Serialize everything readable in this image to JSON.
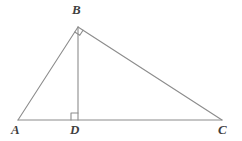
{
  "figure": {
    "type": "geometry-diagram",
    "background_color": "#ffffff",
    "stroke_color": "#8c8c8c",
    "label_color": "#3f3f3f",
    "stroke_width": 1.1
  },
  "points": {
    "A": {
      "label": "A",
      "x": 18,
      "y": 120
    },
    "B": {
      "label": "B",
      "x": 78,
      "y": 27
    },
    "C": {
      "label": "C",
      "x": 222,
      "y": 120
    },
    "D": {
      "label": "D",
      "x": 78,
      "y": 120
    }
  },
  "segments": [
    {
      "name": "AB",
      "from": "A",
      "to": "B"
    },
    {
      "name": "BC",
      "from": "B",
      "to": "C"
    },
    {
      "name": "AC",
      "from": "A",
      "to": "C"
    },
    {
      "name": "BD",
      "from": "B",
      "to": "D"
    }
  ],
  "right_angle_marks": [
    {
      "name": "angle-BDA",
      "vertex": "D",
      "size": 7
    },
    {
      "name": "angle-ABC",
      "vertex": "B",
      "size": 6
    }
  ]
}
